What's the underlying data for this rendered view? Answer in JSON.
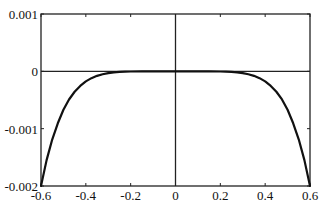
{
  "chart_data": {
    "type": "line",
    "title": "",
    "xlabel": "",
    "ylabel": "",
    "xlim": [
      -0.6,
      0.6
    ],
    "ylim": [
      -0.002,
      0.001
    ],
    "grid": false,
    "legend": null,
    "x_ticks": [
      -0.6,
      -0.4,
      -0.2,
      0,
      0.2,
      0.4,
      0.6
    ],
    "x_tick_labels": [
      "-0.6",
      "-0.4",
      "-0.2",
      "0",
      "0.2",
      "0.4",
      "0.6"
    ],
    "y_ticks": [
      -0.002,
      -0.001,
      0,
      0.001
    ],
    "y_tick_labels": [
      "-0.002",
      "-0.001",
      "0",
      "0.001"
    ],
    "reference_lines": {
      "horizontal_at_y": 0,
      "vertical_at_x": 0
    },
    "series": [
      {
        "name": "curve",
        "color": "#111111",
        "x": [
          -0.6,
          -0.575,
          -0.55,
          -0.525,
          -0.5,
          -0.475,
          -0.45,
          -0.425,
          -0.4,
          -0.375,
          -0.35,
          -0.325,
          -0.3,
          -0.275,
          -0.25,
          -0.225,
          -0.2,
          -0.15,
          -0.1,
          -0.05,
          0,
          0.05,
          0.1,
          0.15,
          0.2,
          0.225,
          0.25,
          0.275,
          0.3,
          0.325,
          0.35,
          0.375,
          0.4,
          0.425,
          0.45,
          0.475,
          0.5,
          0.525,
          0.55,
          0.575,
          0.6
        ],
        "y": [
          -0.002,
          -0.001549,
          -0.00119,
          -0.000906,
          -0.00067,
          -0.000491,
          -0.000356,
          -0.000254,
          -0.000176,
          -0.000119,
          -7.87e-05,
          -5.05e-05,
          -3.13e-05,
          -1.86e-05,
          -1.05e-05,
          -5.6e-06,
          -2.7e-06,
          -5e-07,
          -4e-08,
          0,
          0,
          0,
          -4e-08,
          -5e-07,
          -2.7e-06,
          -5.6e-06,
          -1.05e-05,
          -1.86e-05,
          -3.13e-05,
          -5.05e-05,
          -7.87e-05,
          -0.000119,
          -0.000176,
          -0.000254,
          -0.000356,
          -0.000491,
          -0.00067,
          -0.000906,
          -0.00119,
          -0.001549,
          -0.002
        ]
      }
    ]
  }
}
